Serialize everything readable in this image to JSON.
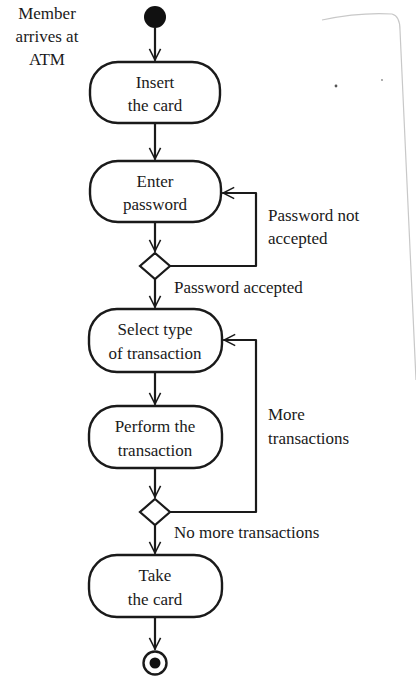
{
  "diagram": {
    "type": "UML activity diagram",
    "start_note": [
      "Member",
      "arrives at",
      "ATM"
    ],
    "nodes": [
      {
        "id": "insert",
        "lines": [
          "Insert",
          "the card"
        ]
      },
      {
        "id": "password",
        "lines": [
          "Enter",
          "password"
        ]
      },
      {
        "id": "select",
        "lines": [
          "Select type",
          "of transaction"
        ]
      },
      {
        "id": "perform",
        "lines": [
          "Perform the",
          "transaction"
        ]
      },
      {
        "id": "take",
        "lines": [
          "Take",
          "the card"
        ]
      }
    ],
    "decisions": [
      {
        "id": "password-check",
        "loop_label": [
          "Password not",
          "accepted"
        ],
        "exit_label": "Password accepted"
      },
      {
        "id": "more-check",
        "loop_label": [
          "More",
          "transactions"
        ],
        "exit_label": "No more transactions"
      }
    ],
    "colors": {
      "ink": "#1a1a1a",
      "background": "#ffffff",
      "scan_edge": "#c8c8c8"
    }
  }
}
